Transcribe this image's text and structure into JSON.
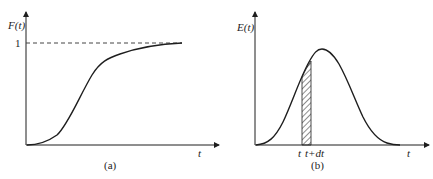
{
  "panels": {
    "a": {
      "caption": "(a)",
      "ylabel": "F(t)",
      "xlabel": "t",
      "y_tick": "1",
      "curve": "cumulative distribution (S-shaped) approaching 1"
    },
    "b": {
      "caption": "(b)",
      "ylabel": "E(t)",
      "xlabel": "t",
      "strip_left_label": "t",
      "strip_right_label": "t+dt",
      "curve": "bell-shaped residence time distribution with hatched strip"
    }
  },
  "colors": {
    "line": "#1e1e1e",
    "dash": "#444444",
    "background": "#ffffff"
  }
}
